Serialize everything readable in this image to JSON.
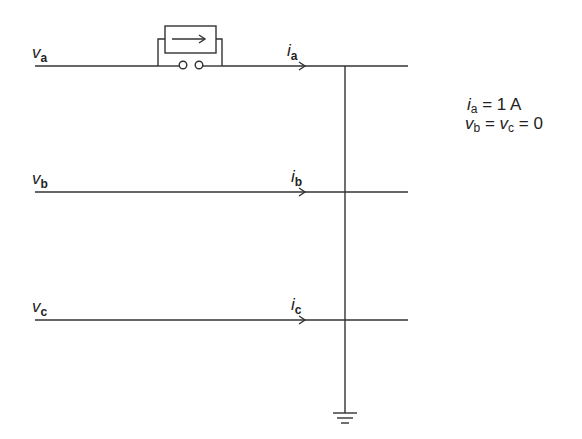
{
  "diagram": {
    "type": "three-phase line fault circuit",
    "lines": [
      {
        "id": "a",
        "voltage_symbol": "v",
        "voltage_sub": "a",
        "current_symbol": "i",
        "current_sub": "a"
      },
      {
        "id": "b",
        "voltage_symbol": "v",
        "voltage_sub": "b",
        "current_symbol": "i",
        "current_sub": "b"
      },
      {
        "id": "c",
        "voltage_symbol": "v",
        "voltage_sub": "c",
        "current_symbol": "i",
        "current_sub": "c"
      }
    ],
    "device": "current-source-with-switch",
    "ground": "ground-symbol",
    "conditions": {
      "line1": {
        "var": "i",
        "sub": "a",
        "rest": " = 1 A"
      },
      "line2": {
        "var1": "v",
        "sub1": "b",
        "mid": " = ",
        "var2": "v",
        "sub2": "c",
        "rest": " = 0"
      }
    },
    "colors": {
      "stroke": "#333333",
      "background": "#ffffff"
    }
  }
}
